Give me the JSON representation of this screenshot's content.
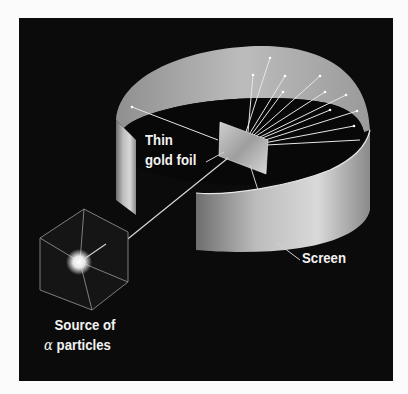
{
  "diagram": {
    "labels": {
      "foil_line1": "Thin",
      "foil_line2": "gold foil",
      "screen": "Screen",
      "source_line1": "Source of",
      "source_alpha": "α",
      "source_line2_rest": " particles"
    },
    "colors": {
      "background": "#0b0b0b",
      "page": "#fbfbfb",
      "screen_light": "#d9d9d9",
      "screen_mid": "#a9a9a9",
      "screen_dark": "#6e6e6e",
      "beam": "#e6e6e6",
      "text": "#f2f2f2"
    },
    "components": [
      "alpha particle source (cube)",
      "particle beam",
      "thin gold foil",
      "circular detection screen",
      "deflected particle paths"
    ]
  }
}
